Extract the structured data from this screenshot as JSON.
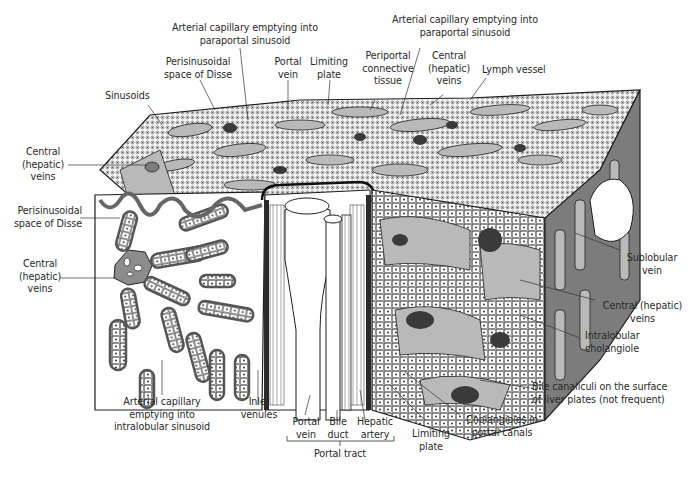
{
  "diagram": {
    "colors": {
      "background": "#ffffff",
      "outline": "#1e1e1e",
      "sinusoid_gray": "#b9b9b9",
      "dark_gray": "#7c7c7c",
      "vein_dark": "#3a3a3a",
      "cell_fill": "#ffffff",
      "label_text": "#2a2a2a"
    },
    "labels": {
      "arterial_cap_top_left": "Arterial capillary emptying into\nparaportal sinusoid",
      "arterial_cap_top_right": "Arterial capillary emptying into\nparaportal sinusoid",
      "perisinusoidal_top": "Perisinusoidal\nspace of Disse",
      "portal_vein_top": "Portal\nvein",
      "limiting_plate_top": "Limiting\nplate",
      "periportal_ct": "Periportal\nconnective\ntissue",
      "central_veins_top": "Central\n(hepatic)\nveins",
      "lymph_vessel": "Lymph vessel",
      "sinusoids": "Sinusoids",
      "central_veins_left_upper": "Central\n(hepatic)\nveins",
      "perisinusoidal_left": "Perisinusoidal\nspace of Disse",
      "central_veins_left_lower": "Central\n(hepatic)\nveins",
      "sublobular_vein": "Sublobular\nvein",
      "central_veins_right": "Central (hepatic)\nveins",
      "intralobular_cholangiole": "Intralobular\ncholangiole",
      "bile_canaliculi": "Bile canaliculi on the surface\nof liver plates (not frequent)",
      "cholangioles_portal": "Cholangioles in\nportal canals",
      "limiting_plate_bottom": "Limiting\nplate",
      "arterial_cap_intralobular": "Arterial capillary\nemptying into\nintralobular sinusoid",
      "inlet_venules": "Inlet\nvenules",
      "portal_vein_bottom": "Portal\nvein",
      "bile_duct": "Bile\nduct",
      "hepatic_artery": "Hepatic\nartery",
      "portal_tract": "Portal tract"
    }
  }
}
